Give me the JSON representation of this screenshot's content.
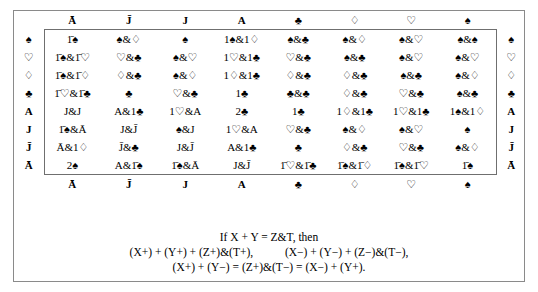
{
  "table": {
    "column_headers": [
      "Ā",
      "J̄",
      "J",
      "A",
      "♣",
      "♢",
      "♡",
      "♠"
    ],
    "row_labels": [
      "♠",
      "♡",
      "♢",
      "♣",
      "A",
      "J",
      "J̄",
      "Ā"
    ],
    "footer_headers": [
      "Ā",
      "J̄",
      "J",
      "A",
      "♣",
      "♢",
      "♡",
      "♠"
    ],
    "right_labels": [
      "♠",
      "♡",
      "♢",
      "♣",
      "A",
      "J",
      "J̄",
      "Ā"
    ],
    "rows": [
      {
        "label": "♠",
        "cells": [
          "1̄♠",
          "♠&♢",
          "♠",
          "1♠&1♢",
          "♠&♣",
          "♠&♢",
          "♠&♡",
          "♠&♠"
        ]
      },
      {
        "label": "♡",
        "cells": [
          "1̄♠&1̄♡",
          "♡&♣",
          "♠&♡",
          "1♡&1♣",
          "♡&♣",
          "♠&♣",
          "♠&♡",
          "♠&♡"
        ]
      },
      {
        "label": "♢",
        "cells": [
          "1̄♠&1̄♢",
          "♢&♣",
          "♠&♢",
          "1♢&1♣",
          "♢&♣",
          "♢&♣",
          "♠&♣",
          "♠&♢"
        ]
      },
      {
        "label": "♣",
        "cells": [
          "1̄♡&1̄♣",
          "♣",
          "♡&♣",
          "1♣",
          "♣&♣",
          "♢&♣",
          "♡&♣",
          "♠&♣"
        ]
      },
      {
        "label": "A",
        "cells": [
          "J&J",
          "A&1♣",
          "1♡&A",
          "2♣",
          "1♣",
          "1♢&1♣",
          "1♡&1♣",
          "1♠&1♢"
        ]
      },
      {
        "label": "J",
        "cells": [
          "1̄♠&Ā",
          "J&J̄",
          "♠&J",
          "1♡&A",
          "♡&♣",
          "♠&♢",
          "♠&♡",
          "♠"
        ]
      },
      {
        "label": "J̄",
        "cells": [
          "Ā&1♢",
          "J̄&♣",
          "J&J̄",
          "A&1♣",
          "♣",
          "♢&♣",
          "♡&♣",
          "♠&♢"
        ]
      },
      {
        "label": "Ā",
        "cells": [
          "2♠",
          "A&1̄♠",
          "1̄♠&Ā",
          "J&J̄",
          "1̄♡&1̄♣",
          "1̄♠&1̄♢",
          "1̄♠&1̄♡",
          "1̄♠"
        ]
      }
    ]
  },
  "formula": {
    "line1": "If X + Y = Z&T, then",
    "line2a": "(X+) + (Y+) + (Z+)&(T+),",
    "line2b": "(X−) + (Y−) + (Z−)&(T−),",
    "line3": "(X+) + (Y−) = (Z+)&(T−) = (X−) + (Y+)."
  }
}
